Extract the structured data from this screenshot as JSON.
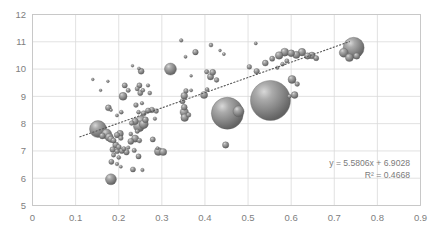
{
  "chart_data": {
    "type": "scatter",
    "title": "",
    "xlabel": "",
    "ylabel": "",
    "xlim": [
      0,
      0.9
    ],
    "ylim": [
      5,
      12
    ],
    "xticks": [
      "0",
      "0.1",
      "0.2",
      "0.3",
      "0.4",
      "0.5",
      "0.6",
      "0.7",
      "0.8",
      "0.9"
    ],
    "yticks": [
      "5",
      "6",
      "7",
      "8",
      "9",
      "10",
      "11",
      "12"
    ],
    "grid": true,
    "legend": "none",
    "marker_style": "3d-sphere-gradient",
    "marker_color": "#7f7f7f",
    "annotations": {
      "equation": "y = 5.5806x + 6.9028",
      "r_squared": "R² = 0.4668"
    },
    "trendline": {
      "type": "linear-dotted",
      "slope": 5.5806,
      "intercept": 6.9028,
      "x_start": 0.11,
      "x_end": 0.735,
      "color": "#595959"
    },
    "points": [
      {
        "x": 0.152,
        "y": 7.8,
        "r": 8.5
      },
      {
        "x": 0.172,
        "y": 7.62,
        "r": 5.0
      },
      {
        "x": 0.178,
        "y": 7.5,
        "r": 4.0
      },
      {
        "x": 0.182,
        "y": 7.43,
        "r": 3.2
      },
      {
        "x": 0.188,
        "y": 7.38,
        "r": 2.6
      },
      {
        "x": 0.162,
        "y": 7.55,
        "r": 3.0
      },
      {
        "x": 0.196,
        "y": 7.58,
        "r": 2.8
      },
      {
        "x": 0.203,
        "y": 7.63,
        "r": 3.4
      },
      {
        "x": 0.205,
        "y": 7.47,
        "r": 2.4
      },
      {
        "x": 0.193,
        "y": 7.22,
        "r": 3.0
      },
      {
        "x": 0.2,
        "y": 7.14,
        "r": 2.6
      },
      {
        "x": 0.186,
        "y": 7.05,
        "r": 2.8
      },
      {
        "x": 0.196,
        "y": 6.98,
        "r": 2.4
      },
      {
        "x": 0.207,
        "y": 7.0,
        "r": 2.6
      },
      {
        "x": 0.212,
        "y": 7.08,
        "r": 2.2
      },
      {
        "x": 0.218,
        "y": 6.95,
        "r": 2.8
      },
      {
        "x": 0.188,
        "y": 6.85,
        "r": 2.2
      },
      {
        "x": 0.2,
        "y": 6.76,
        "r": 2.0
      },
      {
        "x": 0.183,
        "y": 6.6,
        "r": 2.6
      },
      {
        "x": 0.196,
        "y": 6.52,
        "r": 1.8
      },
      {
        "x": 0.205,
        "y": 6.42,
        "r": 1.6
      },
      {
        "x": 0.182,
        "y": 5.96,
        "r": 5.5
      },
      {
        "x": 0.233,
        "y": 6.32,
        "r": 2.6
      },
      {
        "x": 0.255,
        "y": 6.3,
        "r": 1.8
      },
      {
        "x": 0.246,
        "y": 6.8,
        "r": 2.6
      },
      {
        "x": 0.236,
        "y": 7.02,
        "r": 2.2
      },
      {
        "x": 0.222,
        "y": 7.12,
        "r": 1.8
      },
      {
        "x": 0.228,
        "y": 7.35,
        "r": 3.0
      },
      {
        "x": 0.238,
        "y": 7.45,
        "r": 3.6
      },
      {
        "x": 0.248,
        "y": 7.38,
        "r": 2.4
      },
      {
        "x": 0.228,
        "y": 7.62,
        "r": 2.0
      },
      {
        "x": 0.243,
        "y": 7.72,
        "r": 2.2
      },
      {
        "x": 0.247,
        "y": 7.9,
        "r": 5.5
      },
      {
        "x": 0.258,
        "y": 7.98,
        "r": 4.5
      },
      {
        "x": 0.252,
        "y": 8.05,
        "r": 6.5
      },
      {
        "x": 0.262,
        "y": 8.14,
        "r": 3.0
      },
      {
        "x": 0.238,
        "y": 8.08,
        "r": 3.2
      },
      {
        "x": 0.23,
        "y": 8.02,
        "r": 2.4
      },
      {
        "x": 0.258,
        "y": 8.38,
        "r": 2.6
      },
      {
        "x": 0.246,
        "y": 8.42,
        "r": 2.0
      },
      {
        "x": 0.24,
        "y": 8.68,
        "r": 2.4
      },
      {
        "x": 0.254,
        "y": 8.75,
        "r": 1.8
      },
      {
        "x": 0.25,
        "y": 9.12,
        "r": 2.6
      },
      {
        "x": 0.256,
        "y": 9.22,
        "r": 2.0
      },
      {
        "x": 0.243,
        "y": 9.28,
        "r": 2.2
      },
      {
        "x": 0.248,
        "y": 9.4,
        "r": 2.6
      },
      {
        "x": 0.252,
        "y": 9.92,
        "r": 3.0
      },
      {
        "x": 0.247,
        "y": 10.02,
        "r": 1.6
      },
      {
        "x": 0.232,
        "y": 10.12,
        "r": 1.4
      },
      {
        "x": 0.222,
        "y": 9.22,
        "r": 2.2
      },
      {
        "x": 0.214,
        "y": 9.4,
        "r": 2.6
      },
      {
        "x": 0.21,
        "y": 9.0,
        "r": 4.0
      },
      {
        "x": 0.206,
        "y": 8.42,
        "r": 2.0
      },
      {
        "x": 0.196,
        "y": 8.3,
        "r": 1.6
      },
      {
        "x": 0.182,
        "y": 8.5,
        "r": 1.6
      },
      {
        "x": 0.176,
        "y": 8.58,
        "r": 3.0
      },
      {
        "x": 0.158,
        "y": 9.22,
        "r": 1.4
      },
      {
        "x": 0.14,
        "y": 9.62,
        "r": 1.4
      },
      {
        "x": 0.175,
        "y": 9.55,
        "r": 1.4
      },
      {
        "x": 0.268,
        "y": 8.48,
        "r": 2.6
      },
      {
        "x": 0.277,
        "y": 8.5,
        "r": 2.8
      },
      {
        "x": 0.287,
        "y": 8.46,
        "r": 2.4
      },
      {
        "x": 0.284,
        "y": 8.18,
        "r": 1.8
      },
      {
        "x": 0.29,
        "y": 7.1,
        "r": 1.6
      },
      {
        "x": 0.292,
        "y": 6.98,
        "r": 4.0
      },
      {
        "x": 0.303,
        "y": 6.96,
        "r": 3.6
      },
      {
        "x": 0.279,
        "y": 7.42,
        "r": 2.6
      },
      {
        "x": 0.272,
        "y": 9.12,
        "r": 2.0
      },
      {
        "x": 0.268,
        "y": 9.4,
        "r": 1.8
      },
      {
        "x": 0.32,
        "y": 10.0,
        "r": 6.0
      },
      {
        "x": 0.345,
        "y": 11.05,
        "r": 1.8
      },
      {
        "x": 0.355,
        "y": 10.45,
        "r": 1.6
      },
      {
        "x": 0.378,
        "y": 10.62,
        "r": 2.8
      },
      {
        "x": 0.356,
        "y": 9.2,
        "r": 2.4
      },
      {
        "x": 0.352,
        "y": 9.02,
        "r": 3.4
      },
      {
        "x": 0.348,
        "y": 8.82,
        "r": 2.6
      },
      {
        "x": 0.352,
        "y": 8.6,
        "r": 3.0
      },
      {
        "x": 0.352,
        "y": 8.42,
        "r": 4.2
      },
      {
        "x": 0.353,
        "y": 8.22,
        "r": 3.8
      },
      {
        "x": 0.362,
        "y": 8.32,
        "r": 2.4
      },
      {
        "x": 0.368,
        "y": 9.22,
        "r": 1.6
      },
      {
        "x": 0.368,
        "y": 9.75,
        "r": 1.4
      },
      {
        "x": 0.414,
        "y": 10.88,
        "r": 2.0
      },
      {
        "x": 0.404,
        "y": 9.9,
        "r": 2.2
      },
      {
        "x": 0.413,
        "y": 9.72,
        "r": 3.2
      },
      {
        "x": 0.405,
        "y": 9.25,
        "r": 2.0
      },
      {
        "x": 0.398,
        "y": 9.05,
        "r": 3.6
      },
      {
        "x": 0.427,
        "y": 9.6,
        "r": 2.4
      },
      {
        "x": 0.418,
        "y": 9.88,
        "r": 3.0
      },
      {
        "x": 0.452,
        "y": 8.38,
        "r": 16.0
      },
      {
        "x": 0.478,
        "y": 8.45,
        "r": 5.5
      },
      {
        "x": 0.448,
        "y": 7.22,
        "r": 3.2
      },
      {
        "x": 0.444,
        "y": 10.55,
        "r": 1.6
      },
      {
        "x": 0.435,
        "y": 10.68,
        "r": 1.4
      },
      {
        "x": 0.552,
        "y": 8.85,
        "r": 20.0
      },
      {
        "x": 0.518,
        "y": 10.94,
        "r": 1.6
      },
      {
        "x": 0.503,
        "y": 10.08,
        "r": 2.4
      },
      {
        "x": 0.52,
        "y": 9.92,
        "r": 2.8
      },
      {
        "x": 0.54,
        "y": 10.22,
        "r": 3.0
      },
      {
        "x": 0.556,
        "y": 10.38,
        "r": 2.6
      },
      {
        "x": 0.572,
        "y": 10.5,
        "r": 3.8
      },
      {
        "x": 0.585,
        "y": 10.62,
        "r": 4.0
      },
      {
        "x": 0.6,
        "y": 10.58,
        "r": 3.4
      },
      {
        "x": 0.612,
        "y": 10.52,
        "r": 3.6
      },
      {
        "x": 0.625,
        "y": 10.62,
        "r": 3.8
      },
      {
        "x": 0.638,
        "y": 10.48,
        "r": 3.2
      },
      {
        "x": 0.648,
        "y": 10.5,
        "r": 3.4
      },
      {
        "x": 0.658,
        "y": 10.4,
        "r": 2.6
      },
      {
        "x": 0.59,
        "y": 10.3,
        "r": 2.2
      },
      {
        "x": 0.58,
        "y": 10.18,
        "r": 2.0
      },
      {
        "x": 0.568,
        "y": 10.05,
        "r": 1.8
      },
      {
        "x": 0.602,
        "y": 9.62,
        "r": 4.0
      },
      {
        "x": 0.614,
        "y": 9.45,
        "r": 2.4
      },
      {
        "x": 0.608,
        "y": 9.05,
        "r": 3.4
      },
      {
        "x": 0.596,
        "y": 9.0,
        "r": 2.0
      },
      {
        "x": 0.745,
        "y": 10.78,
        "r": 10.5
      },
      {
        "x": 0.722,
        "y": 10.6,
        "r": 4.5
      },
      {
        "x": 0.735,
        "y": 10.42,
        "r": 4.0
      },
      {
        "x": 0.752,
        "y": 10.48,
        "r": 3.2
      }
    ]
  }
}
